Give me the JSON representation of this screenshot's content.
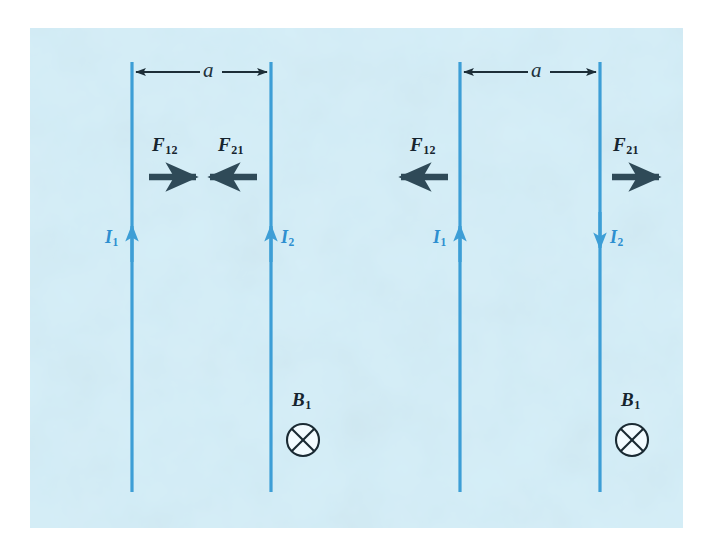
{
  "figure": {
    "canvas": {
      "width": 710,
      "height": 555
    },
    "panel": {
      "background_color": "#d4eef8",
      "page_background_color": "#ffffff",
      "x": 30,
      "y": 28,
      "width": 653,
      "height": 500
    },
    "colors": {
      "wire": "#3d9ed6",
      "current_label": "#2e8fd0",
      "arrow_dark": "#2f4a58",
      "dimension_line": "#1d2e38",
      "field_symbol_stroke": "#1a2a33",
      "field_symbol_fill": "#f2fbff",
      "text_dark": "#16242e"
    }
  },
  "panels": [
    {
      "id": "left",
      "name": "parallel-currents-attraction",
      "dimension": {
        "label": "a",
        "y": 72,
        "x_start": 132,
        "x_end": 271
      },
      "wires": [
        {
          "id": "left-wire-1",
          "x": 132,
          "y_top": 62,
          "y_bottom": 492,
          "current_label_base": "I",
          "current_label_sub": "1",
          "current_direction": "up",
          "label_side": "left",
          "label_x": 108,
          "label_y": 232,
          "arrowhead_y": 238
        },
        {
          "id": "left-wire-2",
          "x": 271,
          "y_top": 62,
          "y_bottom": 492,
          "current_label_base": "I",
          "current_label_sub": "2",
          "current_direction": "up",
          "label_side": "right",
          "label_x": 281,
          "label_y": 232,
          "arrowhead_y": 238
        }
      ],
      "forces": [
        {
          "id": "left-force-12",
          "label_base": "F",
          "label_sub": "12",
          "label_x": 152,
          "label_y": 135,
          "arrow_direction": "right",
          "arrow_y": 177,
          "arrow_x_start": 149,
          "arrow_x_end": 198
        },
        {
          "id": "left-force-21",
          "label_base": "F",
          "label_sub": "21",
          "label_x": 218,
          "label_y": 135,
          "arrow_direction": "left",
          "arrow_x_start": 257,
          "arrow_x_end": 208,
          "arrow_y": 177
        }
      ],
      "field": {
        "id": "left-field-B1",
        "label_base": "B",
        "label_sub": "1",
        "label_x": 294,
        "label_y": 392,
        "symbol": "circle-x-into-page",
        "cx": 303,
        "cy": 440,
        "r": 16
      }
    },
    {
      "id": "right",
      "name": "antiparallel-currents-repulsion",
      "dimension": {
        "label": "a",
        "y": 72,
        "x_start": 460,
        "x_end": 600
      },
      "wires": [
        {
          "id": "right-wire-1",
          "x": 460,
          "y_top": 62,
          "y_bottom": 492,
          "current_label_base": "I",
          "current_label_sub": "1",
          "current_direction": "up",
          "label_side": "left",
          "label_x": 436,
          "label_y": 232,
          "arrowhead_y": 238
        },
        {
          "id": "right-wire-2",
          "x": 600,
          "y_top": 62,
          "y_bottom": 492,
          "current_label_base": "I",
          "current_label_sub": "2",
          "current_direction": "down",
          "label_side": "right",
          "label_x": 610,
          "label_y": 232,
          "arrowhead_y": 238
        }
      ],
      "forces": [
        {
          "id": "right-force-12",
          "label_base": "F",
          "label_sub": "12",
          "label_x": 410,
          "label_y": 135,
          "arrow_direction": "left",
          "arrow_x_start": 448,
          "arrow_x_end": 399,
          "arrow_y": 177
        },
        {
          "id": "right-force-21",
          "label_base": "F",
          "label_sub": "21",
          "label_x": 613,
          "label_y": 135,
          "arrow_direction": "right",
          "arrow_x_start": 612,
          "arrow_x_end": 661,
          "arrow_y": 177
        }
      ],
      "field": {
        "id": "right-field-B1",
        "label_base": "B",
        "label_sub": "1",
        "label_x": 623,
        "label_y": 392,
        "symbol": "circle-x-into-page",
        "cx": 632,
        "cy": 440,
        "r": 16
      }
    }
  ]
}
